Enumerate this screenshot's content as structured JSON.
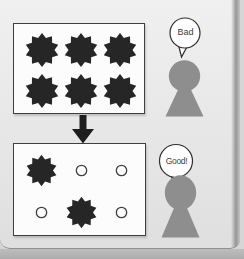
{
  "figure": {
    "top": {
      "bubble_label": "Bad",
      "grid": [
        [
          "burr",
          "burr",
          "burr"
        ],
        [
          "burr",
          "burr",
          "burr"
        ]
      ]
    },
    "bottom": {
      "bubble_label": "Good!",
      "grid": [
        [
          "burr",
          "circle",
          "circle"
        ],
        [
          "circle",
          "burr",
          "circle"
        ]
      ]
    }
  },
  "colors": {
    "panel_bg_top": "#f0f0f0",
    "panel_bg_bottom": "#dfdfdf",
    "outer_bg": "#d6d6d6",
    "bottom_shade": "#adadad",
    "fold_dark": "#969696",
    "box_fill": "#fcfcfc",
    "outline": "#3f3f3f",
    "burr_fill": "#262626",
    "person_fill": "#8e8e8e",
    "bubble_fill": "#ffffff",
    "bubble_stroke": "#2d2d2d",
    "label_color": "#3c3c3c",
    "arrow_fill": "#1e1e1e"
  }
}
